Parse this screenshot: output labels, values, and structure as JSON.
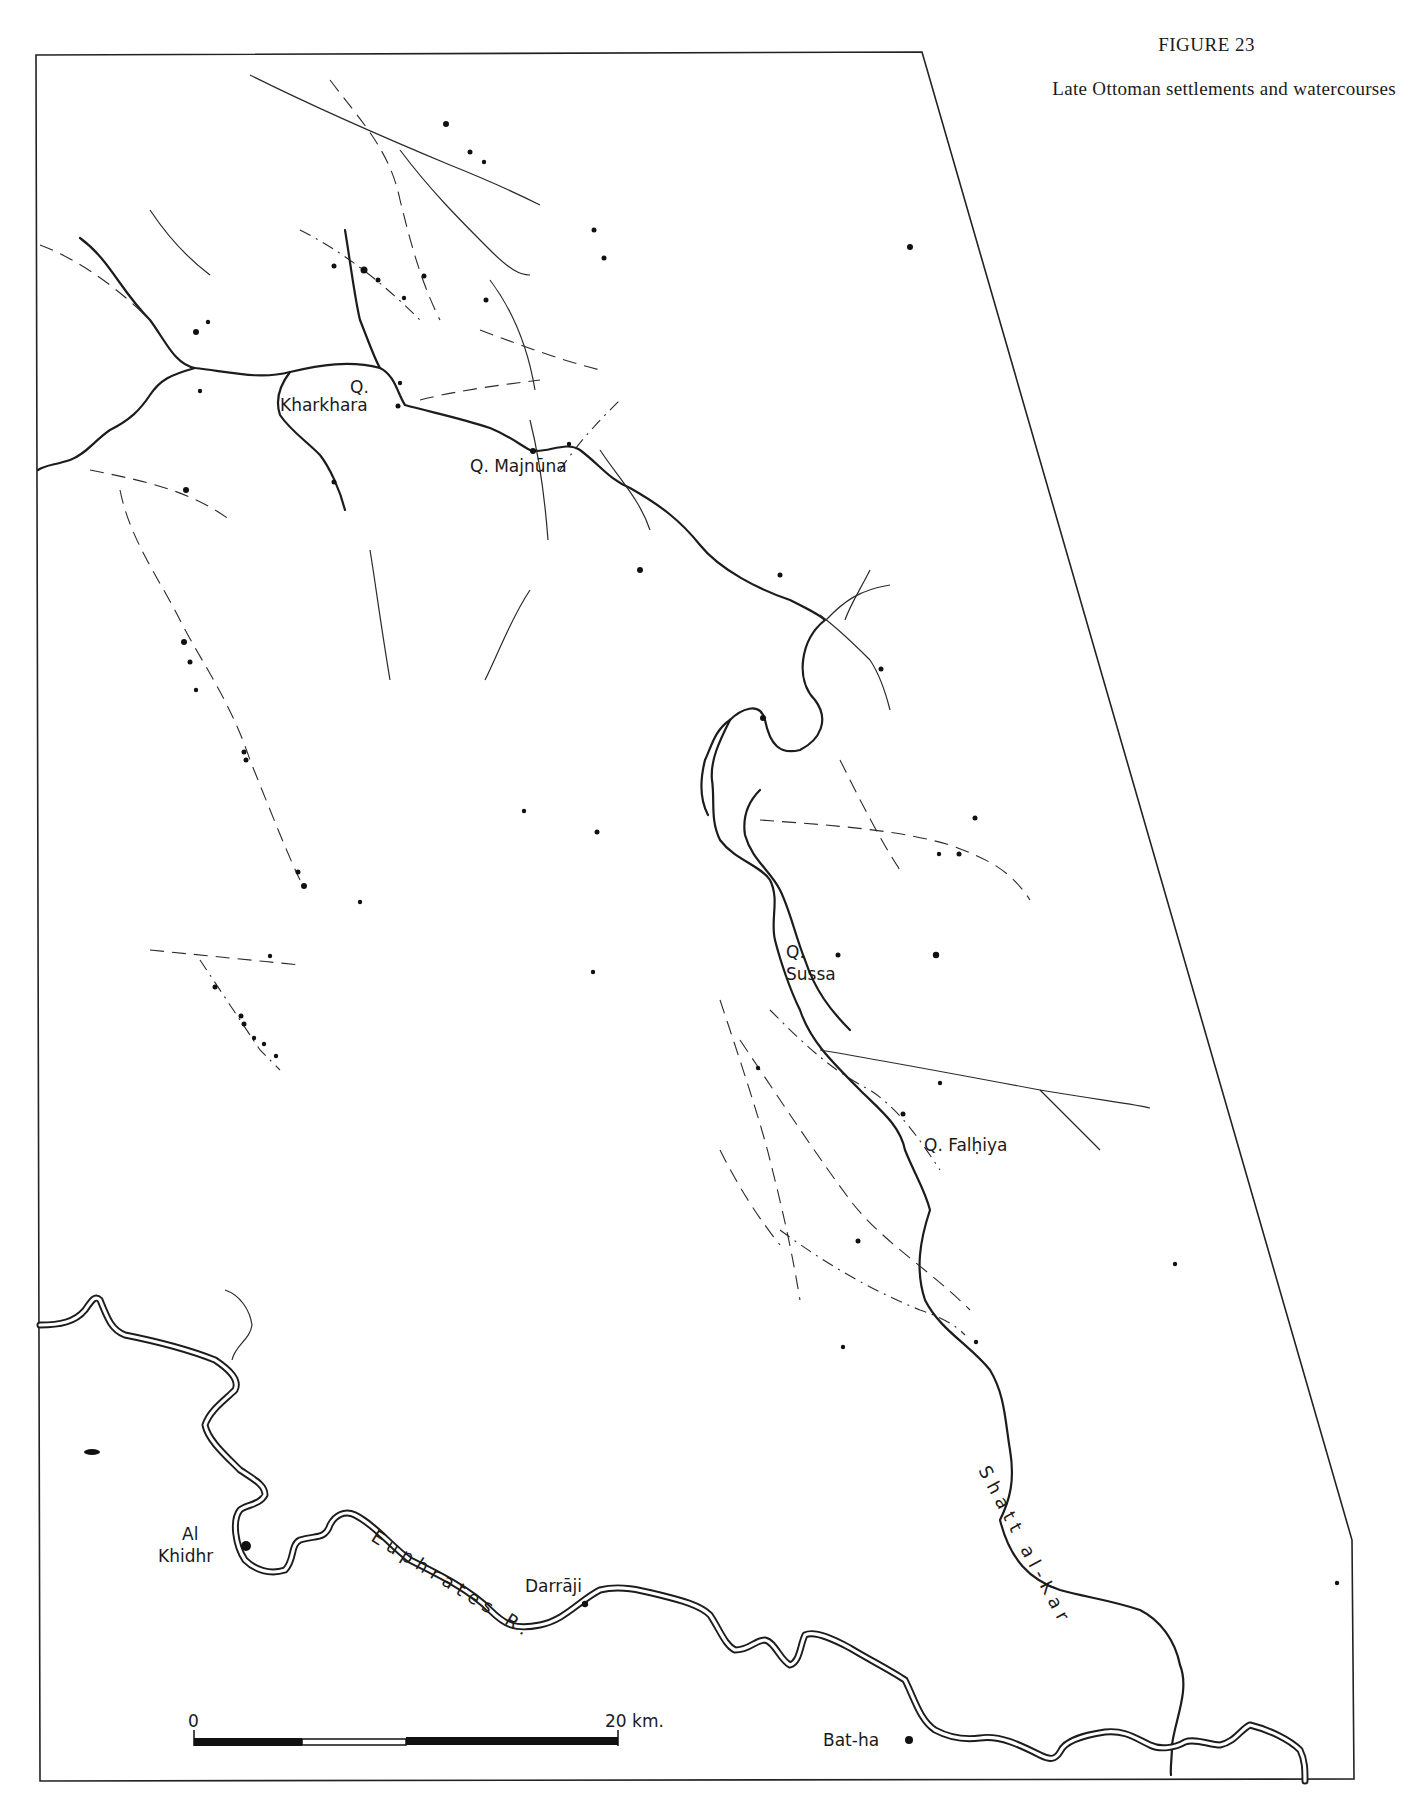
{
  "figure": {
    "number": "FIGURE 23",
    "title": "Late Ottoman settlements and watercourses"
  },
  "settlements": [
    {
      "label_line1": "Q.",
      "label_line2": "Kharkhara"
    },
    {
      "label": "Q. Majnūna"
    },
    {
      "label_line1": "Q.",
      "label_line2": "Sussa"
    },
    {
      "label": "Q. Falḥiya"
    },
    {
      "label_line1": "Al",
      "label_line2": "Khidhr"
    },
    {
      "label": "Darrāji"
    },
    {
      "label": "Bat-ha"
    }
  ],
  "rivers": {
    "euphrates": "Euphrates R.",
    "shatt": "Shatt al-Kar"
  },
  "scale_bar": {
    "start_label": "0",
    "end_label": "20 km.",
    "segments": [
      "black",
      "white",
      "black"
    ]
  },
  "colors": {
    "ink": "#1c1c1c",
    "paper": "#ffffff"
  }
}
